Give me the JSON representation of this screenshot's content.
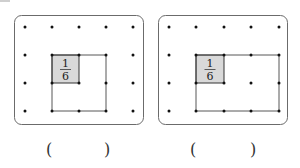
{
  "figures": [
    {
      "id": "figure-1",
      "panel": {
        "x": 14,
        "y": 15,
        "w": 130,
        "h": 110,
        "radius": 7
      },
      "dot_grid": {
        "cols": [
          25,
          52,
          79,
          106,
          133
        ],
        "rows": [
          27,
          55,
          83,
          111
        ]
      },
      "unit_square": {
        "x": 52,
        "y": 55,
        "w": 27,
        "h": 28,
        "fill": "#d9d9d9",
        "label_num": "1",
        "label_den": "6"
      },
      "shape_outline": [
        [
          52,
          55
        ],
        [
          106,
          55
        ],
        [
          106,
          111
        ],
        [
          52,
          111
        ]
      ],
      "answer_blank": {
        "open": "(",
        "close": ")",
        "open_x": 47,
        "close_x": 104
      }
    },
    {
      "id": "figure-2",
      "panel": {
        "x": 158,
        "y": 15,
        "w": 130,
        "h": 110,
        "radius": 7
      },
      "dot_grid": {
        "cols": [
          169,
          196,
          224,
          251,
          279
        ],
        "rows": [
          27,
          55,
          83,
          111
        ]
      },
      "unit_square": {
        "x": 196,
        "y": 55,
        "w": 28,
        "h": 28,
        "fill": "#d9d9d9",
        "label_num": "1",
        "label_den": "6"
      },
      "shape_outline": [
        [
          196,
          55
        ],
        [
          279,
          55
        ],
        [
          279,
          111
        ],
        [
          196,
          111
        ]
      ],
      "answer_blank": {
        "open": "(",
        "close": ")",
        "open_x": 191,
        "close_x": 251
      }
    }
  ],
  "colors": {
    "panel_border": "#6b6b6b",
    "dot": "#111111",
    "line": "#444444",
    "shaded": "#d9d9d9"
  },
  "labels": {
    "fig1_num": "1",
    "fig1_den": "6",
    "fig2_num": "1",
    "fig2_den": "6",
    "fig1_open": "(",
    "fig1_close": ")",
    "fig2_open": "(",
    "fig2_close": ")"
  }
}
